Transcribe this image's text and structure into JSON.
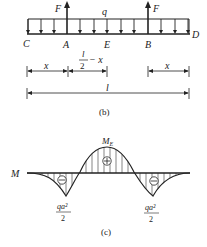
{
  "figure_b": {
    "caption": "(b)",
    "load_label": "q",
    "force_label_left": "F",
    "force_label_right": "F",
    "points": {
      "C": "C",
      "A": "A",
      "E": "E",
      "B": "B",
      "D": "D"
    },
    "dimensions": {
      "left_overhang": "x",
      "half_span_num": "l",
      "half_span_den": "2",
      "half_span_tail": "− x",
      "right_overhang": "x",
      "total_length": "l"
    }
  },
  "figure_c": {
    "caption": "(c)",
    "axis_label": "M",
    "peak_label": "M",
    "peak_subscript": "E",
    "peak_sign": "+",
    "left_sign": "−",
    "right_sign": "−",
    "left_value_num": "qa²",
    "left_value_den": "2",
    "right_value_num": "qa²",
    "right_value_den": "2"
  }
}
